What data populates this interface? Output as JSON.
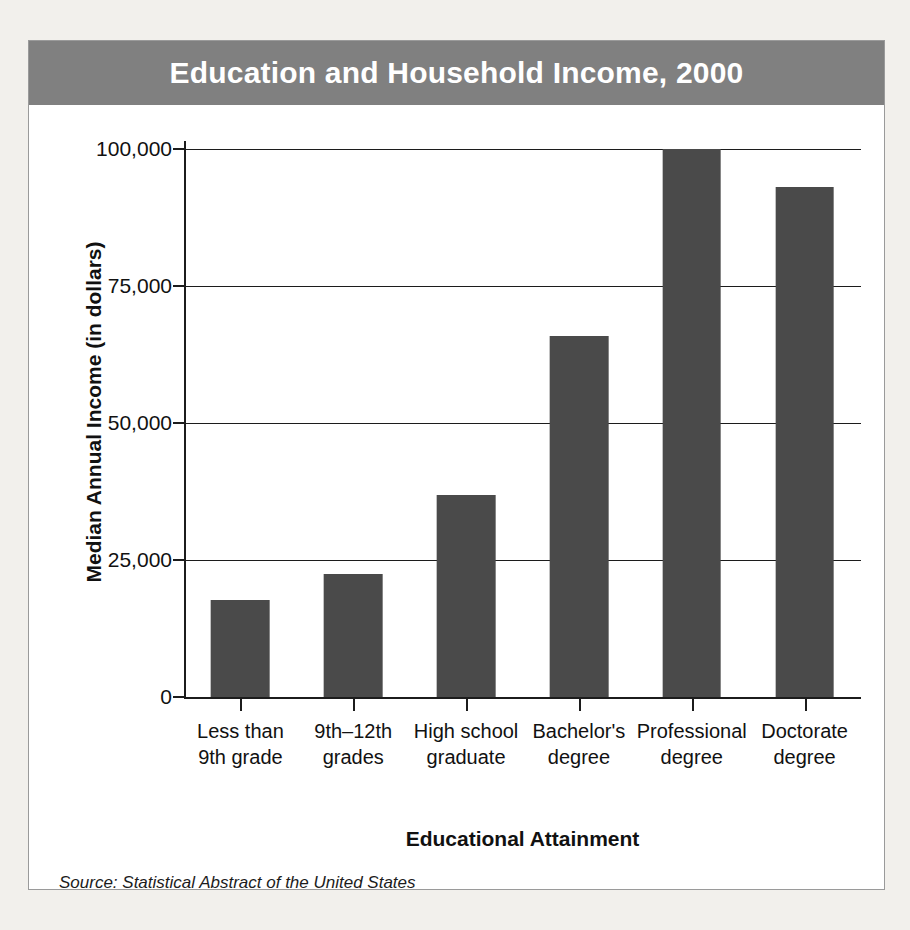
{
  "figure": {
    "title": "Education and Household Income, 2000",
    "source_note": "Source: Statistical Abstract of the United States",
    "header_color": "#808080",
    "bar_color": "#4a4a4a",
    "background_color": "#ffffff",
    "page_color": "#f2f0ec"
  },
  "chart_data": {
    "type": "bar",
    "title": "Education and Household Income, 2000",
    "xlabel": "Educational Attainment",
    "ylabel": "Median Annual Income (in dollars)",
    "categories": [
      "Less than 9th grade",
      "9th–12th grades",
      "High school graduate",
      "Bachelor's degree",
      "Professional degree",
      "Doctorate degree"
    ],
    "category_lines": [
      [
        "Less than",
        "9th grade"
      ],
      [
        "9th–12th",
        "grades"
      ],
      [
        "High school",
        "graduate"
      ],
      [
        "Bachelor's",
        "degree"
      ],
      [
        "Professional",
        "degree"
      ],
      [
        "Doctorate",
        "degree"
      ]
    ],
    "values": [
      17700,
      22400,
      36800,
      65800,
      100000,
      93000
    ],
    "ylim": [
      0,
      100000
    ],
    "yticks": [
      0,
      25000,
      50000,
      75000,
      100000
    ],
    "ytick_labels": [
      "0",
      "25,000",
      "50,000",
      "75,000",
      "100,000"
    ],
    "grid": true,
    "grid_axis": "y",
    "legend": "none",
    "annotations": [
      "Source: Statistical Abstract of the United States"
    ]
  }
}
